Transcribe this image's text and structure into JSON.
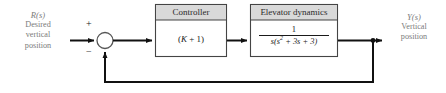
{
  "diagram": {
    "type": "control-system-block-diagram",
    "colors": {
      "line": "#111111",
      "block_border": "#444444",
      "block_header_fill": "#d9d9d9",
      "block_body_fill": "#ffffff",
      "label_text": "#7b7b7b",
      "block_text": "#1a1a1a",
      "background": "#ffffff"
    },
    "input": {
      "symbol": "R(s)",
      "line1": "Desired",
      "line2": "vertical",
      "line3": "position"
    },
    "output": {
      "symbol": "Y(s)",
      "line1": "Vertical",
      "line2": "position"
    },
    "summing_junction": {
      "name": "summing-junction",
      "plus_sign": "+",
      "minus_sign": "−",
      "shape": "circle"
    },
    "blocks": [
      {
        "id": "controller",
        "title": "Controller",
        "body": "(K + 1)",
        "body_parts": {
          "open": "(",
          "gain": "K",
          "plus": " + 1)"
        }
      },
      {
        "id": "elevator-dynamics",
        "title": "Elevator dynamics",
        "numerator": "1",
        "denominator": "s(s^2 + 3s + 3)",
        "denominator_parts": {
          "lead": "s(s",
          "exponent": "2",
          "tail": " + 3s + 3)"
        }
      }
    ],
    "feedback": {
      "name": "feedback-path",
      "description": "unity feedback from output takeoff node to summing junction"
    }
  }
}
